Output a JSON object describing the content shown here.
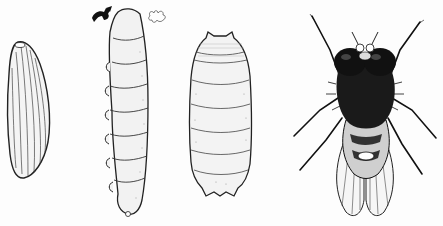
{
  "illustration": {
    "subject": "Fly life cycle",
    "stages": [
      {
        "name": "egg",
        "label": ""
      },
      {
        "name": "larva",
        "label": ""
      },
      {
        "name": "pupa",
        "label": ""
      },
      {
        "name": "adult",
        "label": ""
      }
    ],
    "caption": ""
  },
  "colors": {
    "ink": "#1a1a1a",
    "paper": "#fdfdfd",
    "shade": "#d9d9d9"
  }
}
